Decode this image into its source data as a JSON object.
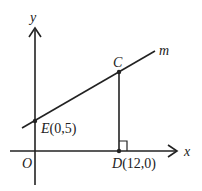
{
  "diagram": {
    "type": "coordinate-geometry",
    "axes": {
      "x_label": "x",
      "y_label": "y",
      "origin_label": "O"
    },
    "line": {
      "name": "m"
    },
    "points": [
      {
        "id": "E",
        "name": "E",
        "coords": "(0,5)",
        "x": 0,
        "y": 5
      },
      {
        "id": "C",
        "name": "C",
        "coords": "",
        "x": 12,
        "y": null
      },
      {
        "id": "D",
        "name": "D",
        "coords": "(12,0)",
        "x": 12,
        "y": 0
      }
    ],
    "segments": [
      {
        "from": "C",
        "to": "D",
        "note": "perpendicular to x-axis"
      }
    ],
    "right_angle_at": "D",
    "colors": {
      "stroke": "#222222",
      "background": "#ffffff"
    }
  }
}
